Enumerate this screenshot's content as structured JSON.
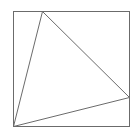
{
  "diagram": {
    "stroke_color": "#6b6b6b",
    "background": "#ffffff",
    "square": {
      "x": 13,
      "y": 11,
      "width": 116,
      "height": 115
    },
    "triangle": {
      "vertices": [
        {
          "x": 42,
          "y": 11
        },
        {
          "x": 129,
          "y": 97
        },
        {
          "x": 13,
          "y": 126
        }
      ]
    }
  }
}
